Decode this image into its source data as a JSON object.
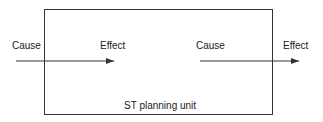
{
  "diagram": {
    "container": {
      "label": "ST planning unit"
    },
    "left_flow": {
      "cause": "Cause",
      "effect": "Effect"
    },
    "right_flow": {
      "cause": "Cause",
      "effect": "Effect"
    },
    "colors": {
      "line": "#333333",
      "text": "#222222",
      "background": "#ffffff"
    }
  }
}
